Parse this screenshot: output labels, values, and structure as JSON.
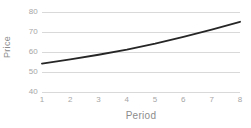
{
  "chart_data": {
    "type": "line",
    "title": "",
    "xlabel": "Period",
    "ylabel": "Price",
    "x": [
      1,
      2,
      3,
      4,
      5,
      6,
      7,
      8
    ],
    "values": [
      54.2,
      56.3,
      58.6,
      61.2,
      64.2,
      67.6,
      71.2,
      75.1
    ],
    "series": [
      {
        "name": "Price",
        "values": [
          54.2,
          56.3,
          58.6,
          61.2,
          64.2,
          67.6,
          71.2,
          75.1
        ],
        "color": "#262626"
      }
    ],
    "xlim": [
      1,
      8
    ],
    "ylim": [
      40,
      80
    ],
    "ytick_labels": [
      "80",
      "70",
      "60",
      "50",
      "40"
    ],
    "ytick_values": [
      80,
      70,
      60,
      50,
      40
    ],
    "xtick_labels": [
      "1",
      "2",
      "3",
      "4",
      "5",
      "6",
      "7",
      "8"
    ],
    "grid": "horizontal",
    "grid_color": "#d9d9d9",
    "legend": "none",
    "background": "#ffffff",
    "tick_label_color": "#a6a6a6",
    "axis_title_color": "#8c8c8c"
  }
}
